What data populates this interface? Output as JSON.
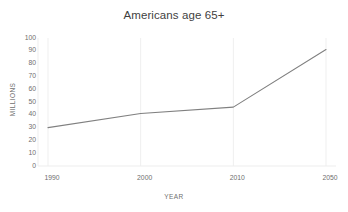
{
  "chart_data": {
    "type": "line",
    "title": "Americans age 65+",
    "xlabel": "YEAR",
    "ylabel": "MILLIONS",
    "categories": [
      "1990",
      "2000",
      "2010",
      "2050"
    ],
    "values": [
      30,
      41,
      46,
      91
    ],
    "series": [
      {
        "name": "Americans age 65+",
        "values": [
          30,
          41,
          46,
          91
        ]
      }
    ],
    "ylim": [
      0,
      100
    ],
    "ytick_labels": [
      "100",
      "90",
      "80",
      "70",
      "60",
      "50",
      "40",
      "30",
      "20",
      "10",
      "0"
    ],
    "ytick_values": [
      100,
      90,
      80,
      70,
      60,
      50,
      40,
      30,
      20,
      10,
      0
    ],
    "ytick_step": 10,
    "grid": "faint-vertical",
    "legend": "none",
    "markers": "none",
    "colors": {
      "line": "#808080",
      "title_text": "#3f3f3f",
      "tick_text": "#6f6f6f",
      "gridline": "#efefef",
      "axis_line": "#ededed",
      "background": "#ffffff"
    }
  }
}
